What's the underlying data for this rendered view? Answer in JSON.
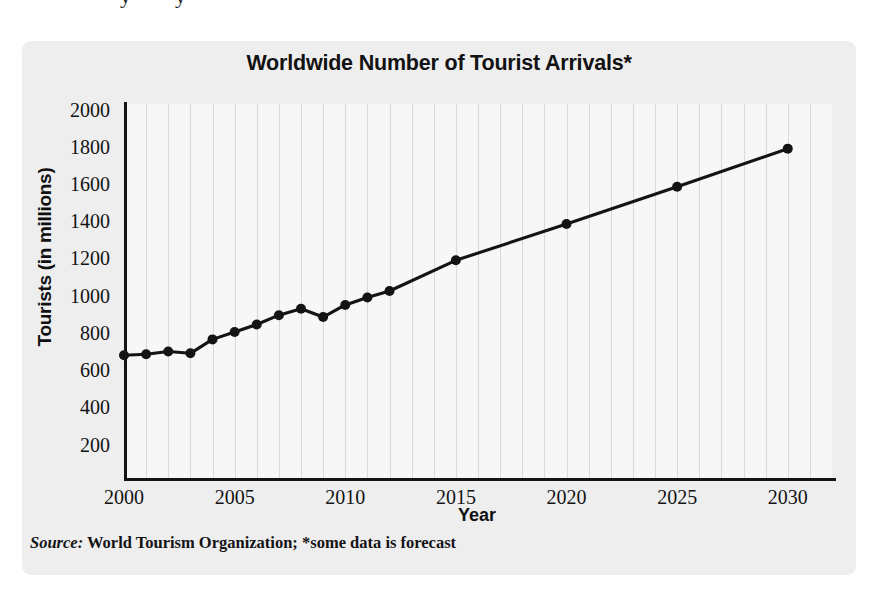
{
  "figure": {
    "title": "Worldwide Number of Tourist Arrivals*",
    "source_prefix": "Source:",
    "source_text": " World Tourism Organization; *some data is forecast",
    "crop_remnants": [
      "y",
      "y"
    ]
  },
  "chart_data": {
    "type": "line",
    "title": "Worldwide Number of Tourist Arrivals*",
    "xlabel": "Year",
    "ylabel": "Tourists (in millions)",
    "xlim": [
      2000,
      2032
    ],
    "ylim": [
      20,
      2030
    ],
    "ytick_values": [
      200,
      400,
      600,
      800,
      1000,
      1200,
      1400,
      1600,
      1800,
      2000
    ],
    "ytick_labels": [
      "200",
      "400",
      "600",
      "800",
      "1000",
      "1200",
      "1400",
      "1600",
      "1800",
      "2000"
    ],
    "xtick_values": [
      2000,
      2005,
      2010,
      2015,
      2020,
      2025,
      2030
    ],
    "xtick_labels": [
      "2000",
      "2005",
      "2010",
      "2015",
      "2020",
      "2025",
      "2030"
    ],
    "grid": "vertical-annual",
    "legend": "none",
    "marker": "filled-circle",
    "line_color": "#141414",
    "marker_color": "#141414",
    "x": [
      2000,
      2001,
      2002,
      2003,
      2004,
      2005,
      2006,
      2007,
      2008,
      2009,
      2010,
      2011,
      2012,
      2015,
      2020,
      2025,
      2030
    ],
    "values": [
      680,
      685,
      700,
      690,
      765,
      805,
      845,
      895,
      930,
      885,
      950,
      990,
      1025,
      1190,
      1385,
      1585,
      1790
    ],
    "annotations": [
      "*some data is forecast"
    ]
  }
}
